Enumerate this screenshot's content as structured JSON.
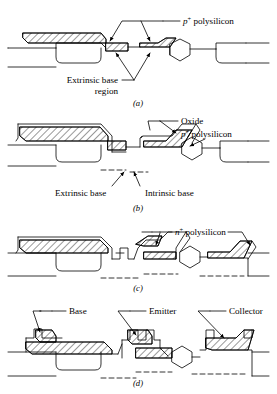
{
  "figure": {
    "title_present": false,
    "style": {
      "ink": "#000000",
      "paper": "#ffffff",
      "line_width": 0.8
    },
    "panels": [
      {
        "id": "a",
        "caption": "(a)",
        "labels": [
          {
            "name": "p-plus-polysilicon",
            "prefix": "p",
            "sup": "+",
            "text": " polysilicon"
          },
          {
            "name": "extrinsic-base-region",
            "line1": "Extrinsic base",
            "line2": "region"
          }
        ]
      },
      {
        "id": "b",
        "caption": "(b)",
        "labels": [
          {
            "name": "oxide",
            "text": "Oxide"
          },
          {
            "name": "p-plus-polysilicon",
            "prefix": "p",
            "sup": "+",
            "text": " polysilicon"
          },
          {
            "name": "extrinsic-base",
            "text": "Extrinsic base"
          },
          {
            "name": "intrinsic-base",
            "text": "Intrinsic base"
          }
        ]
      },
      {
        "id": "c",
        "caption": "(c)",
        "labels": [
          {
            "name": "n-plus-polysilicon",
            "prefix": "n",
            "sup": "+",
            "text": " polysilicon"
          }
        ]
      },
      {
        "id": "d",
        "caption": "(d)",
        "labels": [
          {
            "name": "base",
            "text": "Base"
          },
          {
            "name": "emitter",
            "text": "Emitter"
          },
          {
            "name": "collector",
            "text": "Collector"
          }
        ]
      }
    ]
  },
  "text": {
    "p_prefix": "p",
    "n_prefix": "n",
    "plus": "+",
    "polysilicon": " polysilicon",
    "oxide": "Oxide",
    "extrinsic_base": "Extrinsic base",
    "extrinsic_base_region_l1": "Extrinsic base",
    "extrinsic_base_region_l2": "region",
    "intrinsic_base": "Intrinsic base",
    "base": "Base",
    "emitter": "Emitter",
    "collector": "Collector",
    "cap_a": "(a)",
    "cap_b": "(b)",
    "cap_c": "(c)",
    "cap_d": "(d)"
  }
}
